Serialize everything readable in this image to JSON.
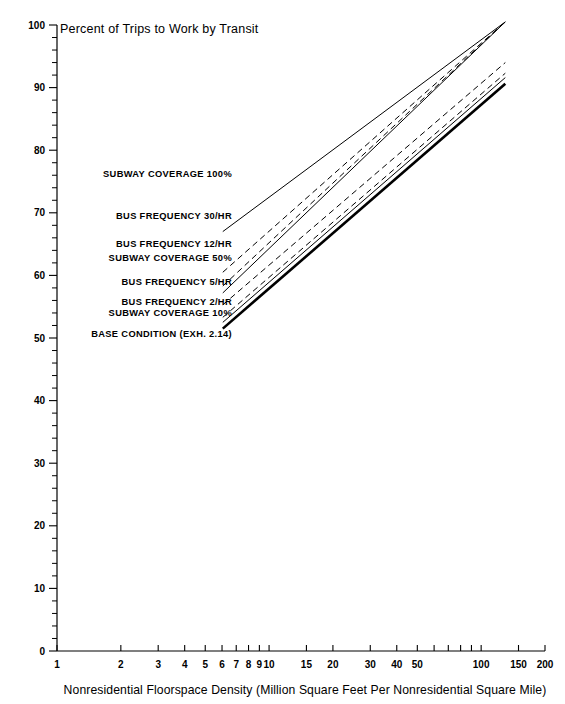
{
  "chart_data": {
    "type": "line",
    "title": "Percent of Trips to Work by Transit",
    "xlabel": "Nonresidential Floorspace Density (Million Square Feet Per Nonresidential Square Mile)",
    "ylabel": "",
    "xscale": "log",
    "xlim": [
      1,
      200
    ],
    "ylim": [
      0,
      100
    ],
    "grid": false,
    "legend_position": "inline-left",
    "x_ticks_labeled": [
      "1",
      "2",
      "3",
      "4",
      "5",
      "6",
      "7",
      "8",
      "9",
      "10",
      "15",
      "20",
      "30",
      "40",
      "50",
      "100",
      "150",
      "200"
    ],
    "y_ticks_labeled": [
      "0",
      "10",
      "20",
      "30",
      "40",
      "50",
      "60",
      "70",
      "80",
      "90",
      "100"
    ],
    "y_tick_step": 10,
    "y_minor_step": 2,
    "series": [
      {
        "name": "SUBWAY COVERAGE 100%",
        "style": "solid",
        "width": 1.0,
        "label_x": 232,
        "label_y": 177,
        "points": [
          [
            6.05,
            67.0
          ],
          [
            130,
            100.5
          ]
        ]
      },
      {
        "name": "BUS FREQUENCY 30/HR",
        "style": "dashed",
        "width": 1.0,
        "label_x": 232,
        "label_y": 219,
        "points": [
          [
            6.05,
            60.5
          ],
          [
            130,
            100.5
          ]
        ]
      },
      {
        "name": "BUS FREQUENCY 12/HR",
        "style": "dashed",
        "width": 1.0,
        "label_x": 232,
        "label_y": 247,
        "points": [
          [
            6.05,
            58.3
          ],
          [
            130,
            100.5
          ]
        ]
      },
      {
        "name": "SUBWAY COVERAGE 50%",
        "style": "solid",
        "width": 1.0,
        "label_x": 232,
        "label_y": 261,
        "points": [
          [
            6.05,
            57.2
          ],
          [
            130,
            100.5
          ]
        ]
      },
      {
        "name": "BUS FREQUENCY 5/HR",
        "style": "dashed",
        "width": 1.0,
        "label_x": 232,
        "label_y": 285,
        "points": [
          [
            6.05,
            55.3
          ],
          [
            130,
            94.0
          ]
        ]
      },
      {
        "name": "BUS FREQUENCY 2/HR",
        "style": "dashed",
        "width": 1.0,
        "label_x": 232,
        "label_y": 305,
        "points": [
          [
            6.05,
            53.3
          ],
          [
            130,
            92.3
          ]
        ]
      },
      {
        "name": "SUBWAY COVERAGE 10%",
        "style": "solid",
        "width": 1.0,
        "label_x": 232,
        "label_y": 316,
        "points": [
          [
            6.05,
            52.5
          ],
          [
            130,
            91.6
          ]
        ]
      },
      {
        "name": "BASE CONDITION (EXH. 2.14)",
        "style": "solid",
        "width": 2.6,
        "label_x": 232,
        "label_y": 337,
        "points": [
          [
            6.05,
            51.5
          ],
          [
            130,
            90.6
          ]
        ]
      }
    ]
  },
  "colors": {
    "ink": "#000000",
    "background": "#ffffff"
  }
}
